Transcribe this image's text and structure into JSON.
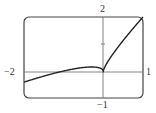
{
  "chart_data": {
    "type": "line",
    "title": "",
    "xlabel": "",
    "ylabel": "",
    "xlim": [
      -2,
      1
    ],
    "ylim": [
      -1,
      2
    ],
    "grid": false,
    "function": "y = x + x^(2/3)",
    "x_tick_labels": [
      "-2",
      "1"
    ],
    "y_tick_labels": [
      "-1",
      "2"
    ],
    "y_ticks": [
      1
    ],
    "series": [
      {
        "name": "f(x)",
        "x": [
          -2,
          -1.5,
          -1,
          -0.75,
          -0.5,
          -0.296,
          -0.1,
          -0.02,
          0,
          0.05,
          0.1,
          0.25,
          0.5,
          0.75,
          1
        ],
        "values": [
          -0.413,
          -0.19,
          0.0,
          0.075,
          0.13,
          0.148,
          0.115,
          0.054,
          0.0,
          0.186,
          0.315,
          0.647,
          1.13,
          1.575,
          2.0
        ]
      }
    ],
    "annotations": [
      "cusp at origin"
    ]
  },
  "labels": {
    "x_min": "−2",
    "x_max": "1",
    "y_max": "2",
    "y_min": "−1"
  }
}
